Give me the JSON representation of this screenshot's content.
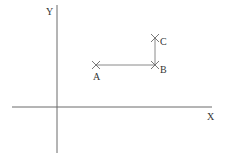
{
  "diagram": {
    "type": "coordinate-sketch",
    "axes": {
      "x_label": "X",
      "y_label": "Y"
    },
    "points": [
      {
        "id": "A",
        "label": "A"
      },
      {
        "id": "B",
        "label": "B"
      },
      {
        "id": "C",
        "label": "C"
      }
    ],
    "segments": [
      {
        "from": "A",
        "to": "B"
      },
      {
        "from": "B",
        "to": "C"
      }
    ],
    "colors": {
      "axis": "#6a6a6a",
      "segment": "#8a8a8a",
      "text": "#333333"
    }
  }
}
